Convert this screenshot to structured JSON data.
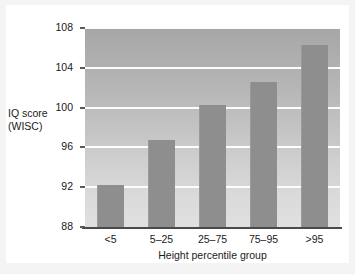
{
  "chart_data": {
    "type": "bar",
    "title": "",
    "xlabel": "Height percentile group",
    "ylabel": "IQ score (WISC)",
    "ylabel_lines": [
      "IQ score",
      "(WISC)"
    ],
    "categories": [
      "<5",
      "5–25",
      "25–75",
      "75–95",
      ">95"
    ],
    "values": [
      92.2,
      96.7,
      100.3,
      102.6,
      106.3
    ],
    "ylim": [
      88,
      108
    ],
    "yticks": [
      88,
      92,
      96,
      100,
      104,
      108
    ],
    "ytick_labels": [
      "88",
      "92",
      "96",
      "100",
      "104",
      "108"
    ],
    "grid": "horizontal",
    "legend": "none",
    "series": [
      {
        "name": "IQ score (WISC)",
        "values": [
          92.2,
          96.7,
          100.3,
          102.6,
          106.3
        ]
      }
    ]
  },
  "colors": {
    "bar_fill": "#8e8e8e",
    "gridline": "#fdfdfd",
    "axis_line": "#4a4a4a",
    "plot_bg_top": "#a6a6a6",
    "plot_bg_bottom": "#e0e0e0",
    "card_bg": "#ffffff",
    "page_bg": "#f4f4f4",
    "text": "#1a1a1a"
  }
}
